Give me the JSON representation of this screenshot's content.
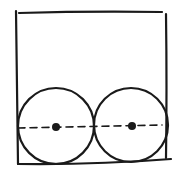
{
  "diagram": {
    "stroke_color": "#1a1a1a",
    "background": "#ffffff",
    "box": {
      "x": 17,
      "y": 12,
      "width": 150,
      "height": 152
    },
    "circles": [
      {
        "cx": 56,
        "cy": 126,
        "r": 38,
        "center_dot": true
      },
      {
        "cx": 131,
        "cy": 125,
        "r": 37,
        "center_dot": true
      }
    ],
    "center_line": {
      "style": "dashed",
      "y": 127
    }
  }
}
